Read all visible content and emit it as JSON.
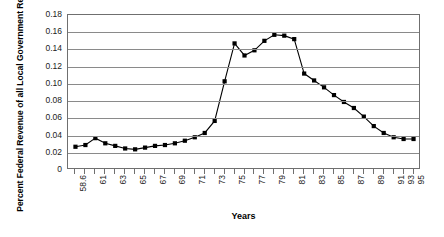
{
  "chart_data": {
    "type": "line",
    "title": "",
    "xlabel": "Years",
    "ylabel": "Percent Federal Revenue of all Local Government Revenue",
    "ylim": [
      0,
      0.18
    ],
    "ytick_labels": [
      "0.18",
      "0.16",
      "0.14",
      "0.12",
      "0.10",
      "0.08",
      "0.06",
      "0.04",
      "0.02",
      "0"
    ],
    "ytick_values": [
      0.18,
      0.16,
      0.14,
      0.12,
      0.1,
      0.08,
      0.06,
      0.04,
      0.02,
      0
    ],
    "grid": true,
    "legend": "none",
    "marker": "square",
    "line_color": "#000000",
    "marker_color": "#000000",
    "xtick_labels": [
      "58.6",
      "",
      "61",
      "",
      "63",
      "",
      "65",
      "",
      "67",
      "",
      "69",
      "",
      "71",
      "",
      "73",
      "",
      "75",
      "",
      "77",
      "",
      "79",
      "",
      "81",
      "",
      "83",
      "",
      "85",
      "",
      "87",
      "",
      "89",
      "",
      "91",
      "93",
      "95"
    ],
    "categories": [
      "58.6",
      "60",
      "61",
      "62",
      "63",
      "64",
      "65",
      "66",
      "67",
      "68",
      "69",
      "70",
      "71",
      "72",
      "73",
      "74",
      "75",
      "76",
      "77",
      "78",
      "79",
      "80",
      "81",
      "82",
      "83",
      "84",
      "85",
      "86",
      "87",
      "88",
      "89",
      "90",
      "91",
      "93",
      "95"
    ],
    "values": [
      0.027,
      0.029,
      0.037,
      0.031,
      0.028,
      0.025,
      0.024,
      0.026,
      0.028,
      0.029,
      0.031,
      0.034,
      0.038,
      0.043,
      0.057,
      0.103,
      0.147,
      0.133,
      0.139,
      0.15,
      0.157,
      0.156,
      0.152,
      0.112,
      0.104,
      0.096,
      0.087,
      0.079,
      0.072,
      0.062,
      0.051,
      0.043,
      0.038,
      0.036,
      0.036
    ]
  }
}
